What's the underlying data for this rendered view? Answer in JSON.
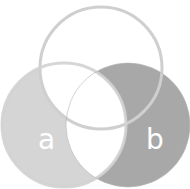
{
  "diagram": {
    "type": "venn",
    "sets": [
      {
        "id": "top",
        "label": "",
        "cx": 101,
        "cy": 68,
        "r": 61
      },
      {
        "id": "a",
        "label": "a",
        "cx": 64,
        "cy": 125,
        "r": 62
      },
      {
        "id": "b",
        "label": "b",
        "cx": 128,
        "cy": 125,
        "r": 62
      }
    ],
    "labels": {
      "a": "a",
      "b": "b"
    },
    "colors": {
      "background": "#ffffff",
      "a_only_fill": "#d5d5d5",
      "b_minus_a_fill": "#a8a8a8",
      "stroke": "#cfcfcf",
      "label": "#ffffff",
      "divider_line": "#e4e4e4"
    },
    "shaded_regions": [
      "a minus (top ∪ b)",
      "b minus a"
    ]
  }
}
